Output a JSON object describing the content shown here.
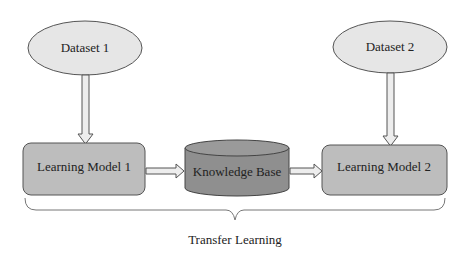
{
  "diagram": {
    "title": "Transfer Learning",
    "nodes": {
      "dataset1": {
        "label": "Dataset 1",
        "shape": "ellipse",
        "fill": "#e6e6e6"
      },
      "dataset2": {
        "label": "Dataset 2",
        "shape": "ellipse",
        "fill": "#e6e6e6"
      },
      "model1": {
        "label": "Learning Model 1",
        "shape": "rounded-rect",
        "fill": "#bdbdbd"
      },
      "model2": {
        "label": "Learning Model 2",
        "shape": "rounded-rect",
        "fill": "#bdbdbd"
      },
      "kb": {
        "label": "Knowledge Base",
        "shape": "cylinder",
        "fill": "#8f8f8f"
      }
    },
    "edges": [
      {
        "from": "dataset1",
        "to": "model1"
      },
      {
        "from": "model1",
        "to": "kb"
      },
      {
        "from": "kb",
        "to": "model2"
      },
      {
        "from": "dataset2",
        "to": "model2"
      }
    ],
    "brace_label": "Transfer Learning"
  }
}
